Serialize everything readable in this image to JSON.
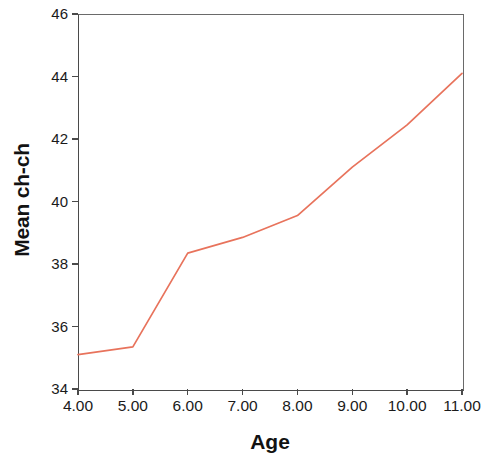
{
  "chart_data": {
    "type": "line",
    "title": "",
    "subtitle": "",
    "xlabel": "Age",
    "ylabel": "Mean ch-ch",
    "x": [
      4,
      5,
      6,
      7,
      8,
      9,
      10,
      11
    ],
    "xtick_labels": [
      "4.00",
      "5.00",
      "6.00",
      "7.00",
      "8.00",
      "9.00",
      "10.00",
      "11.00"
    ],
    "ytick_labels": [
      "34",
      "36",
      "38",
      "40",
      "42",
      "44",
      "46"
    ],
    "ytick_values": [
      34,
      36,
      38,
      40,
      42,
      44,
      46
    ],
    "xlim": [
      4,
      11
    ],
    "ylim": [
      34,
      46
    ],
    "grid": false,
    "legend": null,
    "series": [
      {
        "name": "Mean ch-ch",
        "color": "#E8735C",
        "values": [
          35.1,
          35.35,
          38.35,
          38.85,
          39.55,
          41.1,
          42.45,
          44.1
        ]
      }
    ]
  },
  "axes": {
    "x_title": "Age",
    "y_title": "Mean ch-ch"
  }
}
